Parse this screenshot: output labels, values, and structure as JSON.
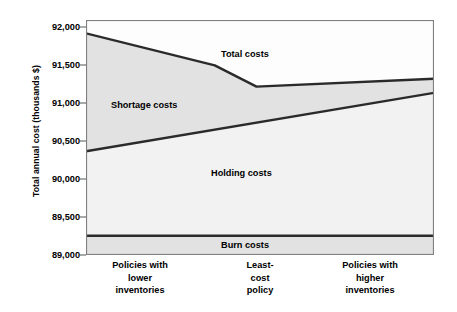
{
  "chart_data": {
    "type": "area",
    "title": "",
    "xlabel": "",
    "ylabel": "Total annual cost (thousands $)",
    "ylim": [
      89000,
      92000
    ],
    "y_ticks": [
      92000,
      91500,
      91000,
      90500,
      90000,
      89500,
      89000
    ],
    "y_tick_labels": [
      "92,000",
      "91,500",
      "91,000",
      "90,500",
      "90,000",
      "89,500",
      "89,000"
    ],
    "grid": false,
    "legend_position": "in-plot-annotations",
    "x_categories": [
      "Policies with lower inventories",
      "Least-cost policy",
      "Policies with higher inventories"
    ],
    "x_tick_labels": [
      [
        "Policies with",
        "lower",
        "inventories"
      ],
      [
        "Least-",
        "cost",
        "policy"
      ],
      [
        "Policies with",
        "higher",
        "inventories"
      ]
    ],
    "x_tick_positions_frac": [
      0.155,
      0.5,
      0.815
    ],
    "annotations": [
      {
        "name": "shortage-costs",
        "text": "Shortage costs"
      },
      {
        "name": "total-costs",
        "text": "Total costs"
      },
      {
        "name": "holding-costs",
        "text": "Holding costs"
      },
      {
        "name": "burn-costs",
        "text": "Burn costs"
      }
    ],
    "series": [
      {
        "name": "Total costs",
        "description": "Upper boundary curve: falls steeply then flattens and rises slightly",
        "x_frac": [
          0.0,
          0.37,
          0.49,
          1.0
        ],
        "values": [
          91830,
          91420,
          91150,
          91250
        ]
      },
      {
        "name": "Holding costs",
        "description": "Middle boundary line: rises linearly left to right",
        "x_frac": [
          0.0,
          1.0
        ],
        "values": [
          90325,
          91070
        ]
      },
      {
        "name": "Burn costs",
        "description": "Constant bottom band",
        "x_frac": [
          0.0,
          1.0
        ],
        "values": [
          89245,
          89245
        ]
      }
    ],
    "bands": [
      {
        "name": "Shortage costs",
        "between": [
          "Holding costs",
          "Total costs"
        ],
        "fill": "#e2e2e2"
      },
      {
        "name": "Holding costs",
        "between": [
          "Burn costs",
          "Holding costs"
        ],
        "fill": "#f0f0f0"
      },
      {
        "name": "Burn costs",
        "between": [
          "baseline",
          "Burn costs"
        ],
        "fill": "#e2e2e2"
      }
    ],
    "colors": {
      "line": "#2a2a2a",
      "shortage_fill": "#e2e2e2",
      "holding_fill": "#f2f2f2",
      "burn_fill": "#e2e2e2",
      "axis": "#707070",
      "text": "#000000",
      "background": "#ffffff"
    }
  }
}
